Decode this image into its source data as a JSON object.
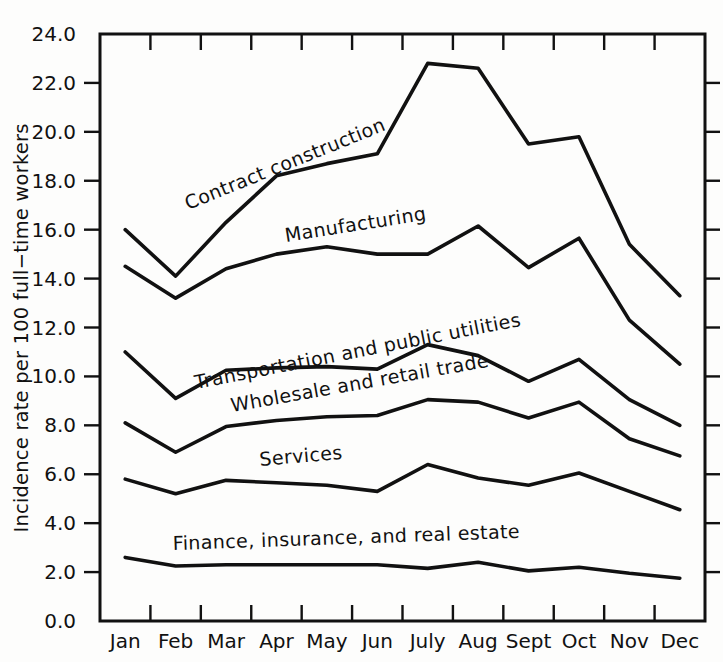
{
  "chart_data": {
    "type": "line",
    "title": "",
    "xlabel": "",
    "ylabel": "Incidence rate per 100 full−time workers",
    "categories": [
      "Jan",
      "Feb",
      "Mar",
      "Apr",
      "May",
      "Jun",
      "July",
      "Aug",
      "Sept",
      "Oct",
      "Nov",
      "Dec"
    ],
    "ylim": [
      0.0,
      24.0
    ],
    "ytick_labels": [
      "0.0",
      "2.0",
      "4.0",
      "6.0",
      "8.0",
      "10.0",
      "12.0",
      "14.0",
      "16.0",
      "18.0",
      "20.0",
      "22.0",
      "24.0"
    ],
    "ytick_values": [
      0.0,
      2.0,
      4.0,
      6.0,
      8.0,
      10.0,
      12.0,
      14.0,
      16.0,
      18.0,
      20.0,
      22.0,
      24.0
    ],
    "grid": false,
    "legend": "inline-labels",
    "line_color": "#111111",
    "background_color": "#fdfdfc",
    "series": [
      {
        "name": "Contract construction",
        "label": "Contract construction",
        "label_rotation": -22,
        "label_x": 188,
        "label_y": 210,
        "values": [
          16.0,
          14.1,
          16.3,
          18.2,
          18.7,
          19.1,
          22.8,
          22.6,
          19.5,
          19.8,
          15.4,
          13.3
        ]
      },
      {
        "name": "Manufacturing",
        "label": "Manufacturing",
        "label_rotation": -9,
        "label_x": 286,
        "label_y": 242,
        "values": [
          14.5,
          13.2,
          14.4,
          15.0,
          15.3,
          15.0,
          15.0,
          16.15,
          14.45,
          15.65,
          12.3,
          10.5
        ]
      },
      {
        "name": "Transportation and public utilities",
        "label": "Transportation and public utilities",
        "label_rotation": -11,
        "label_x": 196,
        "label_y": 389,
        "values": [
          11.0,
          9.1,
          10.25,
          10.35,
          10.4,
          10.3,
          11.3,
          10.85,
          9.8,
          10.7,
          9.05,
          8.0
        ]
      },
      {
        "name": "Wholesale and retail trade",
        "label": "Wholesale and retail trade",
        "label_rotation": -10,
        "label_x": 232,
        "label_y": 412,
        "values": [
          8.1,
          6.9,
          7.95,
          8.2,
          8.35,
          8.4,
          9.05,
          8.95,
          8.3,
          8.95,
          7.45,
          6.75
        ]
      },
      {
        "name": "Services",
        "label": "Services",
        "label_rotation": -5,
        "label_x": 260,
        "label_y": 466,
        "values": [
          5.8,
          5.2,
          5.75,
          5.65,
          5.55,
          5.3,
          6.4,
          5.85,
          5.55,
          6.05,
          5.3,
          4.55
        ]
      },
      {
        "name": "Finance, insurance, and real estate",
        "label": "Finance, insurance, and real estate",
        "label_rotation": -2,
        "label_x": 173,
        "label_y": 550,
        "values": [
          2.6,
          2.25,
          2.3,
          2.3,
          2.3,
          2.3,
          2.15,
          2.4,
          2.05,
          2.2,
          1.95,
          1.75
        ]
      }
    ]
  },
  "axes": {
    "plot_left": 100,
    "plot_right": 705,
    "plot_top": 34,
    "plot_bottom": 621
  }
}
